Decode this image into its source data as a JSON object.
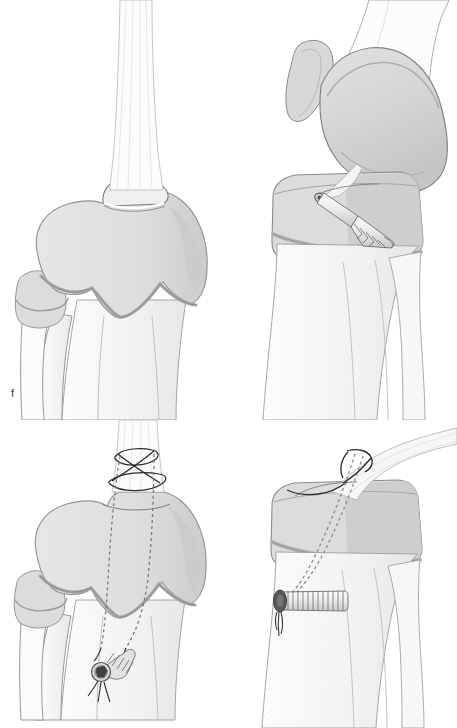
{
  "figure": {
    "background_color": "#ffffff",
    "width": 457,
    "height": 728,
    "panel_count": 4
  },
  "palette": {
    "background": "#ffffff",
    "bone_fill_light": "#fbfbfb",
    "bone_fill_mid": "#f2f2f2",
    "cartilage_fill": "#e0e0e0",
    "cartilage_fill_dark": "#cfcfcf",
    "bone_band": "#c2c2c2",
    "outline": "#8c8c8c",
    "outline_dark": "#6e6e6e",
    "suture_line": "#2b2b2b",
    "implant_fill": "#ededed",
    "implant_shadow": "#b9b9b9",
    "screw_recess": "#3a3a3a",
    "label_text": "#3a3a3a"
  },
  "panels": [
    {
      "id": "f",
      "label": "f",
      "view": "anterior",
      "description": "Anterior view of proximal tibia with patellar tendon attached to the tibial tubercle; fibular head at lateral side; no fixation hardware present.",
      "structures": [
        "patellar-tendon",
        "tibial-tubercle",
        "proximal-tibia",
        "fibular-head",
        "fibula-shaft",
        "tibia-shaft",
        "cartilage-band"
      ],
      "hardware": []
    },
    {
      "id": "g",
      "label": "g",
      "view": "lateral",
      "description": "Lateral view of the knee showing femoral condyle, patella, and the tibial tubercle osteotomy fragment secured with a single obliquely oriented cannulated lag screw.",
      "structures": [
        "patella",
        "femoral-condyle",
        "distal-femur-shaft",
        "proximal-tibia",
        "tibia-shaft",
        "fibula-shaft",
        "cartilage-band"
      ],
      "hardware": [
        {
          "name": "cannulated-lag-screw",
          "orientation": "oblique, anterior-superior to posterior-inferior",
          "count": 1
        }
      ]
    },
    {
      "id": "h",
      "label": "h",
      "view": "anterior",
      "description": "Anterior view with a Krackow locking suture woven through the patellar tendon; the two suture limbs pass distally through bone tunnels and are tied over a cannulated screw post seen end-on.",
      "structures": [
        "patellar-tendon",
        "tibial-tubercle",
        "proximal-tibia",
        "fibular-head",
        "tibia-shaft",
        "cartilage-band"
      ],
      "hardware": [
        {
          "name": "krackow-suture-weave",
          "orientation": "criss-cross around tendon",
          "count": 1
        },
        {
          "name": "suture-limb",
          "orientation": "dashed, passing through bone tunnel",
          "count": 2
        },
        {
          "name": "cannulated-screw-post-end-on",
          "orientation": "axial view with hex recess",
          "count": 1
        }
      ]
    },
    {
      "id": "i",
      "label": "i",
      "view": "lateral",
      "description": "Lateral view with suture passing around the patellar tendon insertion, running obliquely through a bone tunnel in the proximal tibia and tied over a transverse cortical screw post placed in the anterior tibial cortex.",
      "structures": [
        "patellar-tendon",
        "tibial-tubercle",
        "proximal-tibia",
        "tibia-shaft",
        "fibula-shaft",
        "cartilage-band"
      ],
      "hardware": [
        {
          "name": "tendon-suture",
          "orientation": "looped around tendon insertion",
          "count": 1
        },
        {
          "name": "bone-tunnel-suture",
          "orientation": "dashed oblique tunnel",
          "count": 1
        },
        {
          "name": "transverse-cortical-screw-post",
          "orientation": "horizontal in anterior tibial cortex",
          "count": 1
        }
      ]
    }
  ]
}
